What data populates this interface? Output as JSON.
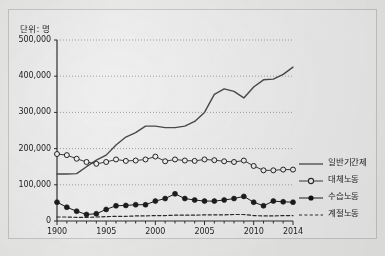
{
  "figure": {
    "unit_label": "단위: 명",
    "background_color": "#ececeb",
    "ink_color": "#333333"
  },
  "chart_data": {
    "type": "line",
    "title": "",
    "subtitle": "",
    "xlabel": "",
    "ylabel": "",
    "unit_note": "단위: 명",
    "grid": true,
    "grid_style": "dotted-horizontal",
    "legend_position": "right",
    "ylim": [
      0,
      500000
    ],
    "ytick_labels": [
      "0",
      "100,000",
      "200,000",
      "300,000",
      "400,000",
      "500,000"
    ],
    "ytick_values": [
      0,
      100000,
      200000,
      300000,
      400000,
      500000
    ],
    "xtick_labels": [
      "1900",
      "1905",
      "2000",
      "2005",
      "2010",
      "2014"
    ],
    "xtick_values": [
      1990,
      1995,
      2000,
      2005,
      2010,
      2014
    ],
    "x": [
      1990,
      1991,
      1992,
      1993,
      1994,
      1995,
      1996,
      1997,
      1998,
      1999,
      2000,
      2001,
      2002,
      2003,
      2004,
      2005,
      2006,
      2007,
      2008,
      2009,
      2010,
      2011,
      2012,
      2013,
      2014
    ],
    "series": [
      {
        "name": "일반기간제",
        "marker": "none",
        "line": "solid",
        "color": "#4a4a4a",
        "values": [
          130000,
          130000,
          131000,
          150000,
          168000,
          182000,
          210000,
          232000,
          244000,
          262000,
          262000,
          258000,
          258000,
          262000,
          275000,
          300000,
          350000,
          365000,
          358000,
          340000,
          370000,
          390000,
          392000,
          405000,
          425000
        ]
      },
      {
        "name": "대체노동",
        "marker": "open-circle",
        "line": "solid",
        "color": "#3c3c3c",
        "values": [
          185000,
          182000,
          172000,
          163000,
          158000,
          163000,
          170000,
          166000,
          167000,
          170000,
          178000,
          165000,
          170000,
          167000,
          166000,
          170000,
          168000,
          165000,
          163000,
          167000,
          152000,
          140000,
          140000,
          142000,
          142000
        ]
      },
      {
        "name": "수습노동",
        "marker": "filled-circle",
        "line": "solid",
        "color": "#1c1c1c",
        "values": [
          52000,
          38000,
          27000,
          18000,
          20000,
          32000,
          42000,
          43000,
          45000,
          45000,
          55000,
          62000,
          75000,
          62000,
          58000,
          55000,
          55000,
          58000,
          62000,
          68000,
          52000,
          42000,
          55000,
          53000,
          52000
        ]
      },
      {
        "name": "계절노동",
        "marker": "none",
        "line": "dashed",
        "color": "#2a2a2a",
        "values": [
          11000,
          11000,
          10000,
          10000,
          11000,
          12000,
          13000,
          13000,
          14000,
          14000,
          15000,
          15000,
          16000,
          16000,
          16000,
          17000,
          17000,
          17000,
          18000,
          18000,
          15000,
          14000,
          14000,
          15000,
          15000
        ]
      }
    ]
  },
  "legend": {
    "items": [
      {
        "label": "일반기간제",
        "key": "solid-line-key"
      },
      {
        "label": "대체노동",
        "key": "open-circle-line-key"
      },
      {
        "label": "수습노동",
        "key": "filled-circle-line-key"
      },
      {
        "label": "계절노동",
        "key": "dashed-line-key"
      }
    ]
  }
}
